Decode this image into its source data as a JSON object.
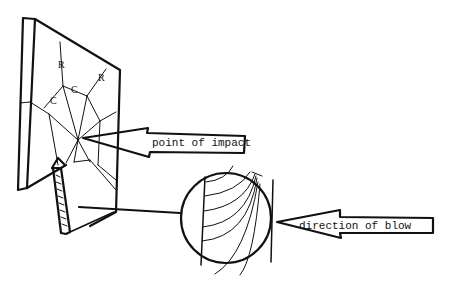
{
  "figure": {
    "background_color": "#ffffff",
    "line_color": "#111111"
  },
  "labels": {
    "point_of_impact": "point of impact",
    "direction_of_blow": "direction of blow"
  },
  "crack_markers": {
    "radial_1": "R",
    "radial_2": "R",
    "concentric_1": "C",
    "concentric_2": "C"
  }
}
